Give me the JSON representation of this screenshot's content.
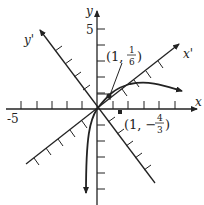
{
  "diagram": {
    "axes": {
      "x_label": "x",
      "y_label": "y",
      "x_rot_label": "x'",
      "y_rot_label": "y'",
      "x_tick_label": "-5",
      "y_tick_label": "5"
    },
    "points": [
      {
        "label_a": "(1, ",
        "num": "1",
        "den": "6",
        "close": ")"
      },
      {
        "label_a": "(1, −",
        "num": "4",
        "den": "3",
        "close": ")"
      }
    ],
    "colors": {
      "ink": "#222222",
      "background": "#ffffff"
    }
  }
}
